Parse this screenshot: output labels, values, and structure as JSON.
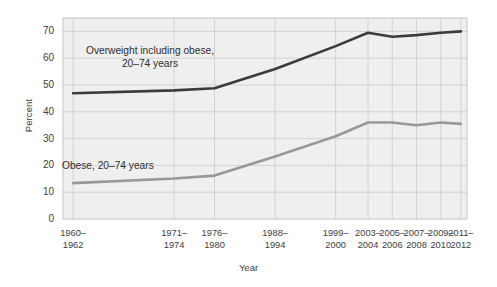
{
  "chart_data": {
    "type": "line",
    "title": "",
    "xlabel": "Year",
    "ylabel": "Percent",
    "ylim": [
      0,
      75
    ],
    "yticks": [
      0,
      10,
      20,
      30,
      40,
      50,
      60,
      70
    ],
    "grid": true,
    "legend_position": "inline-annotation",
    "categories": [
      "1960–1962",
      "1971–1974",
      "1976–1980",
      "1988–1994",
      "1999–2000",
      "2003–2004",
      "2005–2006",
      "2007–2008",
      "2009–2010",
      "2011–2012"
    ],
    "category_lines": [
      [
        "1960–",
        "1962"
      ],
      [
        "1971–",
        "1974"
      ],
      [
        "1976–",
        "1980"
      ],
      [
        "1988–",
        "1994"
      ],
      [
        "1999–",
        "2000"
      ],
      [
        "2003–",
        "2004"
      ],
      [
        "2005–",
        "2006"
      ],
      [
        "2007–",
        "2008"
      ],
      [
        "2009–",
        "2010"
      ],
      [
        "2011–",
        "2012"
      ]
    ],
    "series": [
      {
        "name": "Overweight including obese, 20–74 years",
        "label_lines": [
          "Overweight including obese,",
          "20–74 years"
        ],
        "color": "#3b3b3b",
        "values": [
          46.9,
          48.0,
          48.8,
          56.0,
          64.5,
          69.5,
          68.0,
          68.6,
          69.5,
          70.0
        ]
      },
      {
        "name": "Obese, 20–74 years",
        "label_lines": [
          "Obese, 20–74 years"
        ],
        "color": "#989898",
        "values": [
          13.4,
          15.1,
          16.2,
          23.3,
          30.9,
          36.0,
          36.0,
          35.0,
          36.0,
          35.5
        ]
      }
    ]
  },
  "colors": {
    "plot_background": "#efefef",
    "grid": "#d3d3d3",
    "border": "#c6c6c6",
    "text": "#3d3d3d"
  }
}
